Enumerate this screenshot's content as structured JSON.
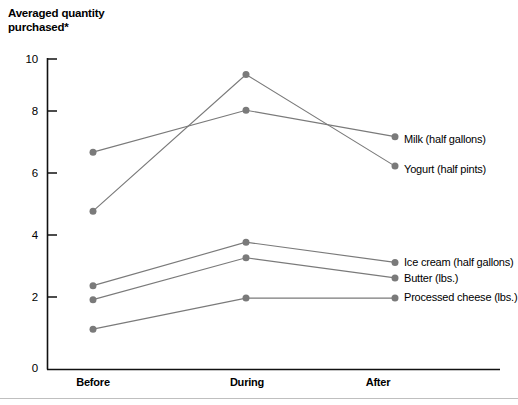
{
  "chart_data": {
    "type": "line",
    "title": "Averaged quantity\npurchased*",
    "xlabel": "",
    "ylabel": "",
    "categories": [
      "Before",
      "During",
      "After"
    ],
    "ylim": [
      0,
      10
    ],
    "yticks": [
      "0",
      "2",
      "4",
      "6",
      "8",
      "10"
    ],
    "grid": false,
    "legend_position": "inline-right",
    "series": [
      {
        "name": "Milk (half gallons)",
        "values": [
          7.0,
          8.35,
          7.5
        ],
        "color": "#7a7a7a"
      },
      {
        "name": "Yogurt (half pints)",
        "values": [
          5.1,
          9.5,
          6.55
        ],
        "color": "#7a7a7a"
      },
      {
        "name": "Ice cream (half gallons)",
        "values": [
          2.7,
          4.1,
          3.45
        ],
        "color": "#7a7a7a"
      },
      {
        "name": "Butter (lbs.)",
        "values": [
          2.25,
          3.6,
          2.95
        ],
        "color": "#7a7a7a"
      },
      {
        "name": "Processed cheese (lbs.)",
        "values": [
          1.3,
          2.3,
          2.3
        ],
        "color": "#7a7a7a"
      }
    ]
  },
  "axis": {
    "y_labels": [
      "10",
      "8",
      "6",
      "4",
      "2",
      "0"
    ],
    "x_labels": [
      "Before",
      "During",
      "After"
    ],
    "axis_color": "#111111"
  },
  "labels": {
    "milk": "Milk (half gallons)",
    "yogurt": "Yogurt (half pints)",
    "ice_cream": "Ice cream (half gallons)",
    "butter": "Butter (lbs.)",
    "processed_cheese": "Processed cheese (lbs.)"
  }
}
